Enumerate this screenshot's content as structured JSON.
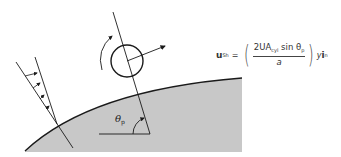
{
  "diagram": {
    "colors": {
      "background": "#ffffff",
      "surface_fill": "#c8c8c8",
      "line": "#1a1a1a",
      "text": "#333333"
    },
    "equation": {
      "lhs_symbol": "u",
      "lhs_subscript": "Sh",
      "equals": "=",
      "open_paren": "(",
      "numerator_prefix": "2UA",
      "numerator_subscript": "cyl",
      "numerator_sin": " sin θ",
      "numerator_theta_subscript": "p",
      "denominator": "a",
      "close_paren": ")",
      "trailing_var": "y",
      "trailing_unit_vector": "i",
      "trailing_unit_subscript": "n"
    },
    "angle_label": {
      "symbol": "θ",
      "subscript": "p"
    },
    "elements": [
      "velocity-profile-arrows",
      "cylinder-circle",
      "rotation-arrow",
      "lift-velocity-arrow",
      "surface-normal-line",
      "curved-surface",
      "angle-arc"
    ]
  }
}
